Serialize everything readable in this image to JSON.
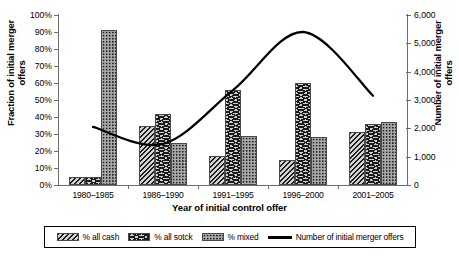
{
  "chart_data": {
    "type": "bar",
    "title": "",
    "xlabel": "Year of initial control offer",
    "ylabel": "Fraction of initial merger offers",
    "y2label": "Number of initial merger offers",
    "categories": [
      "1980–1985",
      "1986–1990",
      "1991–1995",
      "1996–2000",
      "2001–2005"
    ],
    "ylim": [
      0,
      100
    ],
    "y2lim": [
      0,
      6000
    ],
    "grid": false,
    "legend_position": "bottom",
    "yticks": [
      "0%",
      "10%",
      "20%",
      "30%",
      "40%",
      "50%",
      "60%",
      "70%",
      "80%",
      "90%",
      "100%"
    ],
    "ytick_values": [
      0,
      10,
      20,
      30,
      40,
      50,
      60,
      70,
      80,
      90,
      100
    ],
    "y2ticks": [
      "0",
      "1,000",
      "2,000",
      "3,000",
      "4,000",
      "5,000",
      "6,000"
    ],
    "y2tick_values": [
      0,
      1000,
      2000,
      3000,
      4000,
      5000,
      6000
    ],
    "series": [
      {
        "name": "% all cash",
        "axis": "left",
        "pattern": "diagonal-hatch",
        "values": [
          5,
          35,
          17,
          15,
          31
        ]
      },
      {
        "name": "% all sotck",
        "axis": "left",
        "pattern": "chevron-hatch",
        "values": [
          5,
          42,
          56,
          60,
          36
        ]
      },
      {
        "name": "% mixed",
        "axis": "left",
        "pattern": "dotted-stipple",
        "values": [
          91,
          25,
          29,
          28,
          37
        ]
      }
    ],
    "line_series": {
      "name": "Number of initial merger offers",
      "axis": "right",
      "values": [
        2050,
        1450,
        3350,
        5400,
        3150
      ]
    }
  },
  "legend": {
    "entries": [
      {
        "label": "% all cash",
        "swatch": "diagonal-hatch-swatch"
      },
      {
        "label": "% all sotck",
        "swatch": "chevron-hatch-swatch"
      },
      {
        "label": "% mixed",
        "swatch": "dotted-stipple-swatch"
      },
      {
        "label": "Number of initial merger offers",
        "swatch": "line-swatch"
      }
    ]
  },
  "colors": {
    "line": "#000000",
    "axis": "#6e6e6e",
    "bar_cash": "#6b6b6b",
    "bar_stock": "#6b6b6b",
    "bar_mixed": "#a8a8a8",
    "background": "#ffffff"
  }
}
